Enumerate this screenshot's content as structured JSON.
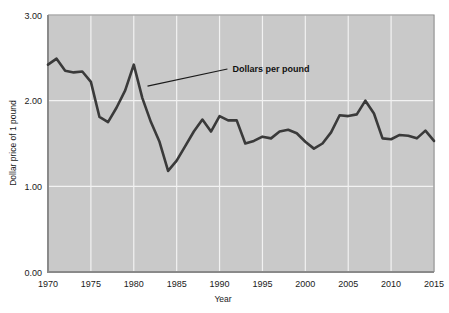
{
  "chart_data": {
    "type": "line",
    "title": "",
    "xlabel": "Year",
    "ylabel": "Dollar price of 1 pound",
    "xlim": [
      1970,
      2015
    ],
    "ylim": [
      0.0,
      3.0
    ],
    "yticks": [
      "0.00",
      "1.00",
      "2.00",
      "3.00"
    ],
    "ytick_values": [
      0.0,
      1.0,
      2.0,
      3.0
    ],
    "xticks": [
      "1970",
      "1975",
      "1980",
      "1985",
      "1990",
      "1995",
      "2000",
      "2005",
      "2010",
      "2015"
    ],
    "xtick_values": [
      1970,
      1975,
      1980,
      1985,
      1990,
      1995,
      2000,
      2005,
      2010,
      2015
    ],
    "grid": true,
    "grid_color": "#f2f2f2",
    "plot_background": "#c9c9c9",
    "line_color": "#3a3a3a",
    "legend": "none",
    "annotations": [
      {
        "text": "Dollars per pound",
        "x": 1991.5,
        "y": 2.37,
        "points_to_x": 1981.6,
        "points_to_y": 2.17
      }
    ],
    "series": [
      {
        "name": "Dollars per pound",
        "x": [
          1970,
          1971,
          1972,
          1973,
          1974,
          1975,
          1976,
          1977,
          1978,
          1979,
          1980,
          1981,
          1982,
          1983,
          1984,
          1985,
          1986,
          1987,
          1988,
          1989,
          1990,
          1991,
          1992,
          1993,
          1994,
          1995,
          1996,
          1997,
          1998,
          1999,
          2000,
          2001,
          2002,
          2003,
          2004,
          2005,
          2006,
          2007,
          2008,
          2009,
          2010,
          2011,
          2012,
          2013,
          2014,
          2015
        ],
        "values": [
          2.42,
          2.49,
          2.35,
          2.33,
          2.34,
          2.22,
          1.81,
          1.75,
          1.92,
          2.12,
          2.42,
          2.03,
          1.75,
          1.52,
          1.18,
          1.3,
          1.47,
          1.64,
          1.78,
          1.64,
          1.82,
          1.77,
          1.77,
          1.5,
          1.53,
          1.58,
          1.56,
          1.64,
          1.66,
          1.62,
          1.52,
          1.44,
          1.5,
          1.63,
          1.83,
          1.82,
          1.84,
          2.0,
          1.85,
          1.56,
          1.55,
          1.6,
          1.59,
          1.56,
          1.65,
          1.53
        ]
      }
    ]
  },
  "figure": {
    "y_axis_title": "Dollar price of 1 pound",
    "x_axis_title": "Year",
    "annotation_label": "Dollars per pound"
  }
}
